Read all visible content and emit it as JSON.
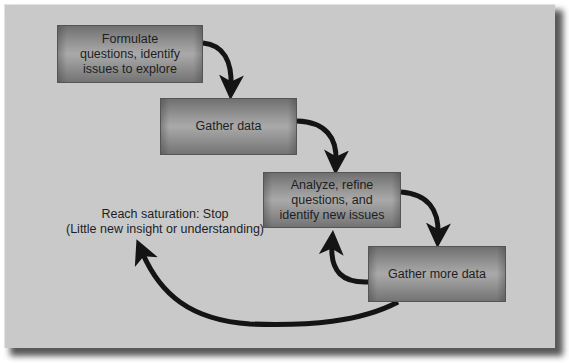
{
  "diagram": {
    "type": "flowchart",
    "steps": [
      {
        "id": "formulate",
        "label": "Formulate questions, identify issues to explore",
        "lines": [
          "Formulate",
          "questions, identify",
          "issues to explore"
        ]
      },
      {
        "id": "gather",
        "label": "Gather data",
        "lines": [
          "Gather data"
        ]
      },
      {
        "id": "analyze",
        "label": "Analyze, refine questions, and identify new issues",
        "lines": [
          "Analyze, refine",
          "questions, and",
          "identify new issues"
        ]
      },
      {
        "id": "gather_more",
        "label": "Gather more data",
        "lines": [
          "Gather more data"
        ]
      }
    ],
    "end_note": {
      "lines": [
        "Reach saturation: Stop",
        "(Little new insight or understanding)"
      ]
    },
    "edges": [
      {
        "from": "formulate",
        "to": "gather"
      },
      {
        "from": "gather",
        "to": "analyze"
      },
      {
        "from": "analyze",
        "to": "gather_more"
      },
      {
        "from": "gather_more",
        "to": "analyze"
      },
      {
        "from": "gather_more",
        "to": "end_note"
      }
    ],
    "colors": {
      "panel": "#c9c9c9",
      "box_mid": "#a9a9a9",
      "box_edge": "#707070",
      "arrow": "#141414",
      "text": "#1e1e1e"
    }
  }
}
